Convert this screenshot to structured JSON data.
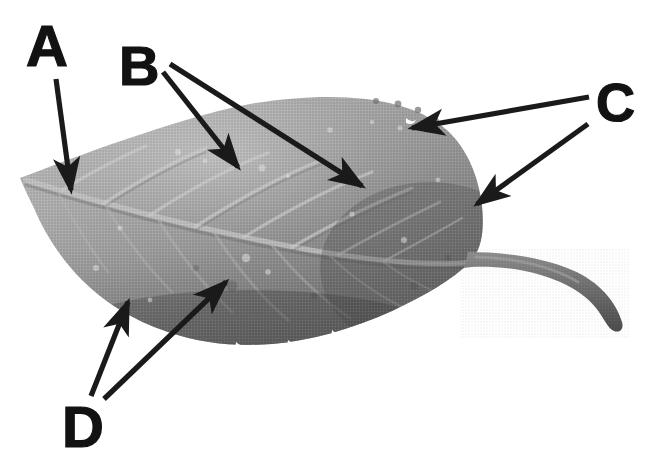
{
  "figure": {
    "type": "labeled-photograph",
    "background_color": "#ffffff",
    "width": 655,
    "height": 471,
    "label_color": "#121212",
    "arrow_color": "#1a1a1a"
  },
  "labels": [
    {
      "id": "A",
      "text": "A",
      "x": 26,
      "y": 17,
      "font_size": 58,
      "points_to": "leaf apex / tip region",
      "arrow_count": 1
    },
    {
      "id": "B",
      "text": "B",
      "x": 119,
      "y": 38,
      "font_size": 56,
      "points_to": "lateral veins on leaf blade",
      "arrow_count": 2
    },
    {
      "id": "C",
      "text": "C",
      "x": 596,
      "y": 75,
      "font_size": 54,
      "points_to": "leaf margin / base region",
      "arrow_count": 2
    },
    {
      "id": "D",
      "text": "D",
      "x": 62,
      "y": 398,
      "font_size": 58,
      "points_to": "lower leaf margin and blade surface",
      "arrow_count": 2
    }
  ],
  "arrows": [
    {
      "label": "A",
      "from_x": 56,
      "from_y": 79,
      "to_x": 71,
      "to_y": 190
    },
    {
      "label": "B",
      "from_x": 163,
      "from_y": 72,
      "to_x": 238,
      "to_y": 167
    },
    {
      "label": "B",
      "from_x": 170,
      "from_y": 64,
      "to_x": 362,
      "to_y": 186
    },
    {
      "label": "C",
      "from_x": 589,
      "from_y": 97,
      "to_x": 412,
      "to_y": 128
    },
    {
      "label": "C",
      "from_x": 588,
      "from_y": 124,
      "to_x": 477,
      "to_y": 204
    },
    {
      "label": "D",
      "from_x": 91,
      "from_y": 396,
      "to_x": 128,
      "to_y": 302
    },
    {
      "label": "D",
      "from_x": 104,
      "from_y": 399,
      "to_x": 226,
      "to_y": 282
    }
  ],
  "leaf": {
    "description": "Grayscale halftone scan of an ovate leaf, apex at left, petiole curving to lower right",
    "tip_point": {
      "x": 20,
      "y": 178
    },
    "petiole_start": {
      "x": 482,
      "y": 262
    },
    "petiole_end": {
      "x": 622,
      "y": 327
    },
    "tone_light": "#b4b4b4",
    "tone_mid": "#8f8f8f",
    "tone_dark": "#6a6a6a",
    "tone_shadow": "#4e4e4e"
  }
}
